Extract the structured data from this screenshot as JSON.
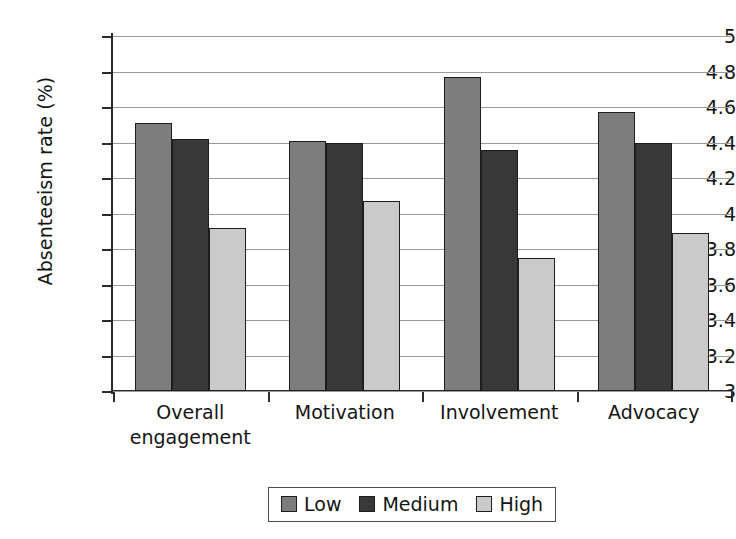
{
  "chart_data": {
    "type": "bar",
    "title": "",
    "xlabel": "",
    "ylabel": "Absenteeism rate (%)",
    "ylim": [
      3,
      5
    ],
    "ytick_step": 0.2,
    "yticks": [
      "5",
      "4.8",
      "4.6",
      "4.4",
      "4.2",
      "4",
      "3.8",
      "3.6",
      "3.4",
      "3.2",
      "3"
    ],
    "grid": true,
    "legend_position": "bottom",
    "categories": [
      "Overall engagement",
      "Motivation",
      "Involvement",
      "Advocacy"
    ],
    "category_lines": [
      [
        "Overall",
        "engagement"
      ],
      [
        "Motivation"
      ],
      [
        "Involvement"
      ],
      [
        "Advocacy"
      ]
    ],
    "series": [
      {
        "name": "Low",
        "color": "#7d7d7d",
        "values": [
          4.51,
          4.41,
          4.77,
          4.57
        ]
      },
      {
        "name": "Medium",
        "color": "#383838",
        "values": [
          4.42,
          4.4,
          4.36,
          4.4
        ]
      },
      {
        "name": "High",
        "color": "#cacaca",
        "values": [
          3.92,
          4.07,
          3.75,
          3.89
        ]
      }
    ]
  },
  "legend": {
    "items": [
      {
        "label": "Low",
        "swatch": "legend-swatch-low"
      },
      {
        "label": "Medium",
        "swatch": "legend-swatch-medium"
      },
      {
        "label": "High",
        "swatch": "legend-swatch-high"
      }
    ]
  }
}
